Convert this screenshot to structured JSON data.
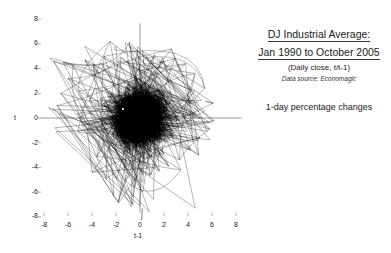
{
  "caption": {
    "title_line1": "DJ Industrial Average:",
    "title_line2": "Jan 1990 to October 2005",
    "subtitle": "(Daily close, t/t-1)",
    "source": "Data source: Economagic",
    "note": "1-day percentage changes"
  },
  "chart_data": {
    "type": "scatter",
    "title": "DJ Industrial Average: Jan 1990 to October 2005",
    "subtitle": "(Daily close, t/t-1)",
    "annotation": "1-day percentage changes",
    "source": "Data source: Economagic",
    "xlabel": "t-1",
    "ylabel": "t",
    "xlim": [
      -8,
      8
    ],
    "ylim": [
      -8,
      8
    ],
    "xticks": [
      -8,
      -6,
      -4,
      -2,
      0,
      2,
      4,
      6,
      8
    ],
    "yticks": [
      -8,
      -6,
      -4,
      -2,
      0,
      2,
      4,
      6,
      8
    ],
    "xtick_labels": [
      "-8",
      "-6",
      "-4",
      "-2",
      "0",
      "2",
      "4",
      "6",
      "8"
    ],
    "ytick_labels": [
      "-8",
      "-6",
      "-4",
      "-2",
      "0",
      "2",
      "4",
      "6",
      "8"
    ],
    "grid": false,
    "legend": null,
    "connected": true,
    "line_color": "#000000",
    "axis_color": "#9a9a9a",
    "n_points": 3980,
    "cloud_center": [
      0,
      0
    ],
    "cloud_sd": [
      1.0,
      1.0
    ],
    "outlier_points": [
      [
        -7.2,
        4.6
      ],
      [
        -6.4,
        4.5
      ],
      [
        -6.0,
        3.2
      ],
      [
        -5.6,
        4.3
      ],
      [
        -5.1,
        2.2
      ],
      [
        -4.6,
        4.7
      ],
      [
        -4.4,
        -0.2
      ],
      [
        -4.2,
        1.4
      ],
      [
        -3.9,
        4.3
      ],
      [
        -3.6,
        -3.1
      ],
      [
        -3.2,
        4.4
      ],
      [
        -3.0,
        5.0
      ],
      [
        -2.8,
        -4.9
      ],
      [
        -2.5,
        6.2
      ],
      [
        -2.2,
        -6.3
      ],
      [
        -2.0,
        5.8
      ],
      [
        -1.8,
        -6.8
      ],
      [
        -1.6,
        4.9
      ],
      [
        -1.2,
        -5.1
      ],
      [
        -0.9,
        6.1
      ],
      [
        -0.6,
        -7.0
      ],
      [
        -0.2,
        5.4
      ],
      [
        0.2,
        -7.3
      ],
      [
        0.5,
        4.9
      ],
      [
        0.9,
        -4.6
      ],
      [
        1.2,
        5.1
      ],
      [
        1.6,
        -4.3
      ],
      [
        2.0,
        4.6
      ],
      [
        2.4,
        -3.9
      ],
      [
        2.9,
        4.8
      ],
      [
        3.3,
        -3.4
      ],
      [
        3.8,
        4.4
      ],
      [
        4.2,
        -2.6
      ],
      [
        4.6,
        3.6
      ],
      [
        5.0,
        -1.6
      ],
      [
        5.4,
        2.4
      ],
      [
        5.8,
        -0.9
      ],
      [
        6.1,
        1.2
      ],
      [
        4.9,
        -3.0
      ],
      [
        3.4,
        -4.2
      ],
      [
        -5.2,
        -1.1
      ],
      [
        -6.6,
        2.0
      ],
      [
        -6.9,
        1.0
      ],
      [
        -4.0,
        -4.4
      ],
      [
        2.6,
        5.6
      ]
    ]
  }
}
